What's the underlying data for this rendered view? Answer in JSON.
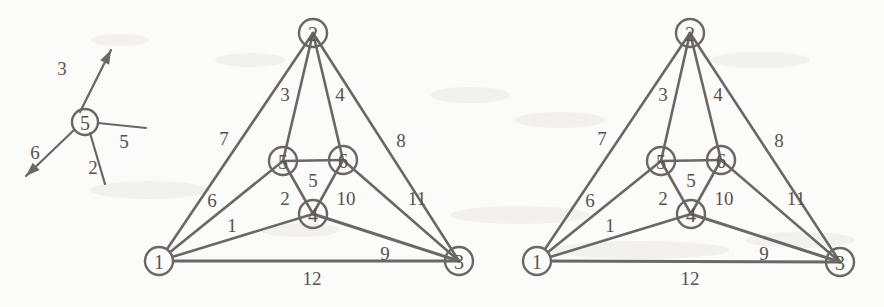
{
  "figure": {
    "background_color": "#fbfbf9",
    "ink_color": "#6b6764",
    "text_color": "#57534f"
  },
  "inset": {
    "name": "orientation-inset",
    "center_node_label": "5",
    "center": {
      "x": 85,
      "y": 122
    },
    "radius": 13,
    "rays": [
      {
        "label": "3",
        "label_x": 62,
        "label_y": 68,
        "from_x": 80,
        "from_y": 112,
        "to_x": 111,
        "to_y": 50,
        "arrow": true
      },
      {
        "label": "5",
        "label_x": 124,
        "label_y": 141,
        "from_x": 98,
        "from_y": 123,
        "to_x": 146,
        "to_y": 128,
        "arrow": false
      },
      {
        "label": "2",
        "label_x": 93,
        "label_y": 167,
        "from_x": 90,
        "from_y": 133,
        "to_x": 105,
        "to_y": 184,
        "arrow": false
      },
      {
        "label": "6",
        "label_x": 35,
        "label_y": 152,
        "from_x": 74,
        "from_y": 130,
        "to_x": 26,
        "to_y": 176,
        "arrow": true
      }
    ]
  },
  "graphs": [
    {
      "name": "graph-left",
      "origin_x": 0,
      "nodes": [
        {
          "id": "1",
          "label": "1",
          "x": 159,
          "y": 261,
          "r": 14
        },
        {
          "id": "2",
          "label": "2",
          "x": 313,
          "y": 33,
          "r": 14
        },
        {
          "id": "3",
          "label": "3",
          "x": 459,
          "y": 261,
          "r": 14
        },
        {
          "id": "4",
          "label": "4",
          "x": 313,
          "y": 214,
          "r": 14
        },
        {
          "id": "5",
          "label": "5",
          "x": 283,
          "y": 161,
          "r": 14
        },
        {
          "id": "6",
          "label": "6",
          "x": 343,
          "y": 160,
          "r": 14
        }
      ],
      "edges": [
        {
          "label": "1",
          "from": "1",
          "to": "4",
          "label_x": 232,
          "label_y": 225
        },
        {
          "label": "2",
          "from": "5",
          "to": "4",
          "label_x": 285,
          "label_y": 198
        },
        {
          "label": "3",
          "from": "2",
          "to": "5",
          "label_x": 285,
          "label_y": 94
        },
        {
          "label": "4",
          "from": "2",
          "to": "6",
          "label_x": 340,
          "label_y": 94
        },
        {
          "label": "5",
          "from": "5",
          "to": "6",
          "label_x": 313,
          "label_y": 180
        },
        {
          "label": "6",
          "from": "1",
          "to": "5",
          "label_x": 212,
          "label_y": 200
        },
        {
          "label": "7",
          "from": "1",
          "to": "2",
          "label_x": 224,
          "label_y": 138
        },
        {
          "label": "8",
          "from": "2",
          "to": "3",
          "label_x": 401,
          "label_y": 140
        },
        {
          "label": "9",
          "from": "4",
          "to": "3",
          "label_x": 385,
          "label_y": 253
        },
        {
          "label": "10",
          "from": "6",
          "to": "4",
          "label_x": 346,
          "label_y": 198
        },
        {
          "label": "11",
          "from": "6",
          "to": "3",
          "label_x": 417,
          "label_y": 198
        },
        {
          "label": "12",
          "from": "1",
          "to": "3",
          "label_x": 312,
          "label_y": 278
        }
      ]
    },
    {
      "name": "graph-right",
      "origin_x": 378,
      "nodes": [
        {
          "id": "1",
          "label": "1",
          "x": 537,
          "y": 261,
          "r": 14
        },
        {
          "id": "2",
          "label": "2",
          "x": 690,
          "y": 33,
          "r": 14
        },
        {
          "id": "3",
          "label": "3",
          "x": 840,
          "y": 262,
          "r": 14
        },
        {
          "id": "4",
          "label": "4",
          "x": 691,
          "y": 214,
          "r": 14
        },
        {
          "id": "5",
          "label": "5",
          "x": 661,
          "y": 161,
          "r": 14
        },
        {
          "id": "6",
          "label": "6",
          "x": 721,
          "y": 160,
          "r": 14
        }
      ],
      "edges": [
        {
          "label": "1",
          "from": "1",
          "to": "4",
          "label_x": 610,
          "label_y": 225
        },
        {
          "label": "2",
          "from": "5",
          "to": "4",
          "label_x": 663,
          "label_y": 198
        },
        {
          "label": "3",
          "from": "2",
          "to": "5",
          "label_x": 663,
          "label_y": 94
        },
        {
          "label": "4",
          "from": "2",
          "to": "6",
          "label_x": 718,
          "label_y": 94
        },
        {
          "label": "5",
          "from": "5",
          "to": "6",
          "label_x": 691,
          "label_y": 180
        },
        {
          "label": "6",
          "from": "1",
          "to": "5",
          "label_x": 590,
          "label_y": 200
        },
        {
          "label": "7",
          "from": "1",
          "to": "2",
          "label_x": 602,
          "label_y": 138
        },
        {
          "label": "8",
          "from": "2",
          "to": "3",
          "label_x": 779,
          "label_y": 140
        },
        {
          "label": "9",
          "from": "4",
          "to": "3",
          "label_x": 764,
          "label_y": 253
        },
        {
          "label": "10",
          "from": "6",
          "to": "4",
          "label_x": 724,
          "label_y": 198
        },
        {
          "label": "11",
          "from": "6",
          "to": "3",
          "label_x": 796,
          "label_y": 198
        },
        {
          "label": "12",
          "from": "1",
          "to": "3",
          "label_x": 690,
          "label_y": 278
        }
      ]
    }
  ]
}
